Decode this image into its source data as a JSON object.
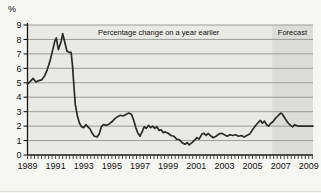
{
  "chart_data": {
    "type": "line",
    "title": "",
    "unit_label": "%",
    "annotation": "Percentage change on a year earlier",
    "forecast_label": "Forecast",
    "xlabel": "",
    "ylabel": "%",
    "xlim": [
      1989,
      2009.3
    ],
    "ylim": [
      0,
      9
    ],
    "y_ticks": [
      0,
      1,
      2,
      3,
      4,
      5,
      6,
      7,
      8,
      9
    ],
    "x_tick_years": [
      1989,
      1991,
      1993,
      1995,
      1997,
      1999,
      2001,
      2003,
      2005,
      2007,
      2009
    ],
    "x_tick_labels": [
      "1989",
      "1991",
      "1993",
      "1995",
      "1997",
      "1999",
      "2001",
      "2003",
      "2005",
      "2007",
      "2009"
    ],
    "minor_tick_interval_years": 0.25,
    "grid": true,
    "legend": "none",
    "forecast_start": 2006.4,
    "forecast_end": 2009.3,
    "series": [
      {
        "name": "Inflation, percentage change on a year earlier",
        "points": [
          [
            1989.0,
            4.9
          ],
          [
            1989.2,
            5.1
          ],
          [
            1989.4,
            5.3
          ],
          [
            1989.6,
            5.05
          ],
          [
            1989.8,
            5.15
          ],
          [
            1990.0,
            5.2
          ],
          [
            1990.2,
            5.45
          ],
          [
            1990.4,
            5.9
          ],
          [
            1990.6,
            6.5
          ],
          [
            1990.8,
            7.3
          ],
          [
            1990.95,
            7.9
          ],
          [
            1991.05,
            8.1
          ],
          [
            1991.2,
            7.3
          ],
          [
            1991.4,
            7.9
          ],
          [
            1991.5,
            8.4
          ],
          [
            1991.65,
            7.8
          ],
          [
            1991.8,
            7.2
          ],
          [
            1991.95,
            7.1
          ],
          [
            1992.1,
            7.1
          ],
          [
            1992.2,
            6.2
          ],
          [
            1992.3,
            4.8
          ],
          [
            1992.4,
            3.5
          ],
          [
            1992.55,
            2.7
          ],
          [
            1992.7,
            2.2
          ],
          [
            1992.85,
            1.95
          ],
          [
            1993.0,
            1.9
          ],
          [
            1993.15,
            2.1
          ],
          [
            1993.3,
            1.95
          ],
          [
            1993.45,
            1.8
          ],
          [
            1993.6,
            1.5
          ],
          [
            1993.75,
            1.3
          ],
          [
            1993.95,
            1.25
          ],
          [
            1994.1,
            1.45
          ],
          [
            1994.25,
            1.95
          ],
          [
            1994.4,
            2.1
          ],
          [
            1994.6,
            2.05
          ],
          [
            1994.8,
            2.15
          ],
          [
            1995.0,
            2.3
          ],
          [
            1995.2,
            2.5
          ],
          [
            1995.4,
            2.65
          ],
          [
            1995.6,
            2.75
          ],
          [
            1995.8,
            2.7
          ],
          [
            1996.0,
            2.8
          ],
          [
            1996.2,
            2.9
          ],
          [
            1996.4,
            2.8
          ],
          [
            1996.55,
            2.4
          ],
          [
            1996.7,
            1.9
          ],
          [
            1996.85,
            1.5
          ],
          [
            1997.0,
            1.3
          ],
          [
            1997.15,
            1.6
          ],
          [
            1997.3,
            1.95
          ],
          [
            1997.45,
            1.85
          ],
          [
            1997.6,
            2.05
          ],
          [
            1997.75,
            1.9
          ],
          [
            1997.9,
            2.0
          ],
          [
            1998.05,
            1.85
          ],
          [
            1998.2,
            1.95
          ],
          [
            1998.35,
            1.7
          ],
          [
            1998.5,
            1.75
          ],
          [
            1998.65,
            1.55
          ],
          [
            1998.8,
            1.6
          ],
          [
            1999.0,
            1.5
          ],
          [
            1999.2,
            1.35
          ],
          [
            1999.4,
            1.3
          ],
          [
            1999.6,
            1.1
          ],
          [
            1999.8,
            1.05
          ],
          [
            2000.0,
            0.85
          ],
          [
            2000.2,
            0.75
          ],
          [
            2000.35,
            0.85
          ],
          [
            2000.5,
            0.7
          ],
          [
            2000.7,
            0.85
          ],
          [
            2000.9,
            1.05
          ],
          [
            2001.05,
            1.2
          ],
          [
            2001.2,
            1.1
          ],
          [
            2001.4,
            1.45
          ],
          [
            2001.55,
            1.5
          ],
          [
            2001.7,
            1.35
          ],
          [
            2001.85,
            1.5
          ],
          [
            2002.0,
            1.35
          ],
          [
            2002.2,
            1.2
          ],
          [
            2002.4,
            1.3
          ],
          [
            2002.6,
            1.45
          ],
          [
            2002.8,
            1.5
          ],
          [
            2003.0,
            1.4
          ],
          [
            2003.2,
            1.3
          ],
          [
            2003.4,
            1.4
          ],
          [
            2003.6,
            1.35
          ],
          [
            2003.8,
            1.4
          ],
          [
            2004.0,
            1.3
          ],
          [
            2004.2,
            1.35
          ],
          [
            2004.4,
            1.25
          ],
          [
            2004.6,
            1.35
          ],
          [
            2004.8,
            1.45
          ],
          [
            2005.0,
            1.75
          ],
          [
            2005.2,
            2.0
          ],
          [
            2005.4,
            2.25
          ],
          [
            2005.55,
            2.4
          ],
          [
            2005.7,
            2.2
          ],
          [
            2005.85,
            2.35
          ],
          [
            2006.0,
            2.1
          ],
          [
            2006.15,
            2.0
          ],
          [
            2006.3,
            2.2
          ],
          [
            2006.45,
            2.3
          ],
          [
            2006.6,
            2.5
          ],
          [
            2006.8,
            2.7
          ],
          [
            2007.0,
            2.9
          ],
          [
            2007.1,
            2.85
          ],
          [
            2007.3,
            2.55
          ],
          [
            2007.5,
            2.25
          ],
          [
            2007.7,
            2.05
          ],
          [
            2007.85,
            1.95
          ],
          [
            2008.0,
            2.1
          ],
          [
            2008.2,
            2.0
          ],
          [
            2008.5,
            2.0
          ],
          [
            2008.8,
            2.0
          ],
          [
            2009.1,
            2.0
          ],
          [
            2009.3,
            2.0
          ]
        ]
      }
    ],
    "colors": {
      "page_bg": "#f6f6f3",
      "plot_bg": "#e9e9e6",
      "forecast_bg": "#dcdcd8",
      "gridline": "#9c9c9c",
      "axis": "#1a1a1a",
      "line": "#2b2b2b",
      "text": "#111111"
    }
  }
}
